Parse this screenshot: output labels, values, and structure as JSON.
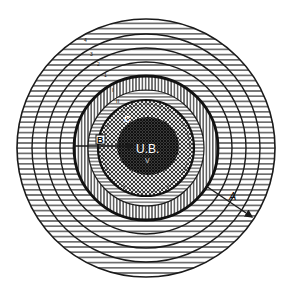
{
  "diagram": {
    "type": "concentric-zones",
    "center": {
      "x": 146,
      "y": 148
    },
    "outer_rings": [
      {
        "r": 129,
        "label": ""
      },
      {
        "r": 114,
        "label": "4"
      },
      {
        "r": 100,
        "label": "3"
      },
      {
        "r": 86,
        "label": "2"
      },
      {
        "r": 79,
        "label": "1"
      }
    ],
    "zones": [
      {
        "name": "outer-horizontal-zone",
        "r_outer": 129,
        "r_inner": 72,
        "pattern": "horizontal-lines"
      },
      {
        "name": "vertical-stripe-band",
        "r_outer": 72,
        "r_inner": 58,
        "pattern": "vertical-lines",
        "label": "I"
      },
      {
        "name": "inner-horizontal-band",
        "r_outer": 58,
        "r_inner": 48,
        "pattern": "horizontal-lines",
        "label": "II"
      },
      {
        "name": "crosshatch-ring",
        "r_outer": 48,
        "r_inner": 30,
        "pattern": "crosshatch",
        "label": "C"
      },
      {
        "name": "dark-core",
        "r_outer": 30,
        "r_inner": 0,
        "pattern": "dense-crosshatch",
        "label": "U.B."
      }
    ],
    "labels": {
      "core": "U.B.",
      "core_sub": "V",
      "ring_b": "B",
      "ring_c": "C",
      "radius_a": "A",
      "band_i": "I",
      "band_ii": "II",
      "ring_1": "1",
      "ring_2": "2",
      "ring_3": "3",
      "ring_4": "4"
    },
    "colors": {
      "ink": "#1a1a1a",
      "paper": "#ffffff",
      "core": "#2b2b2b"
    }
  }
}
